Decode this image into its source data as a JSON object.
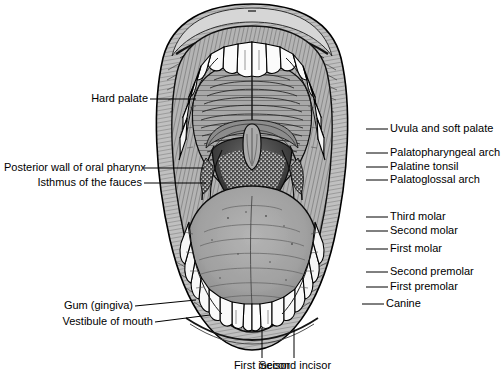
{
  "figure": {
    "style": "black and white engraving",
    "colors": {
      "background": "#ffffff",
      "ink": "#000000",
      "mucosa_light": "#b9b9b9",
      "mucosa_mid": "#9a9a9a",
      "mucosa_dark": "#6e6e6e",
      "tongue": "#a0a0a0",
      "pharynx_dark": "#3a3a3a",
      "tooth": "#fdfdfd",
      "lip": "#c2c2c2"
    }
  },
  "labels": {
    "hard_palate": "Hard palate",
    "posterior_wall": "Posterior wall of oral pharynx",
    "isthmus": "Isthmus of the fauces",
    "gum": "Gum (gingiva)",
    "vestibule": "Vestibule of mouth",
    "uvula": "Uvula and soft palate",
    "palatopharyngeal": "Palatopharyngeal arch",
    "palatine_tonsil": "Palatine tonsil",
    "palatoglossal": "Palatoglossal arch",
    "third_molar": "Third molar",
    "second_molar": "Second molar",
    "first_molar": "First molar",
    "second_premolar": "Second premolar",
    "first_premolar": "First premolar",
    "canine": "Canine",
    "first_incisor": "First incisor",
    "second_incisor": "Second incisor"
  }
}
